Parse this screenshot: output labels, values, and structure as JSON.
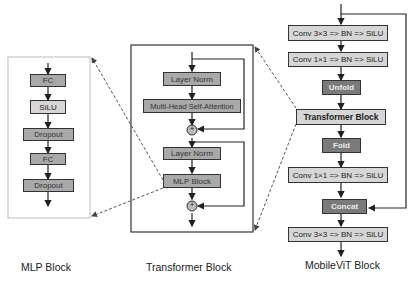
{
  "mlp_block": {
    "caption": "MLP Block",
    "layers": [
      "FC",
      "SiLU",
      "Dropout",
      "FC",
      "Dropout"
    ]
  },
  "transformer_block": {
    "caption": "Transformer Block",
    "layers": [
      "Layer Norm",
      "Multi-Head Self-Attention",
      "Layer Norm",
      "MLP Block"
    ],
    "add_symbol": "+"
  },
  "mobilevit_block": {
    "caption": "MobileViT Block",
    "layers": [
      "Conv 3×3 => BN => SiLU",
      "Conv 1×1 => BN => SiLU",
      "Unfold",
      "Transformer Block",
      "Fold",
      "Conv 1×1 => BN => SiLU",
      "Concat",
      "Conv 3×3 => BN => SiLU"
    ]
  },
  "colors": {
    "light_box": "#d6d6d6",
    "mid_box": "#a9a9a9",
    "dark_box": "#7a7a7a",
    "line": "#333333",
    "panel_border_mlp": "#bcbcbc",
    "panel_border_transformer": "#333333"
  }
}
